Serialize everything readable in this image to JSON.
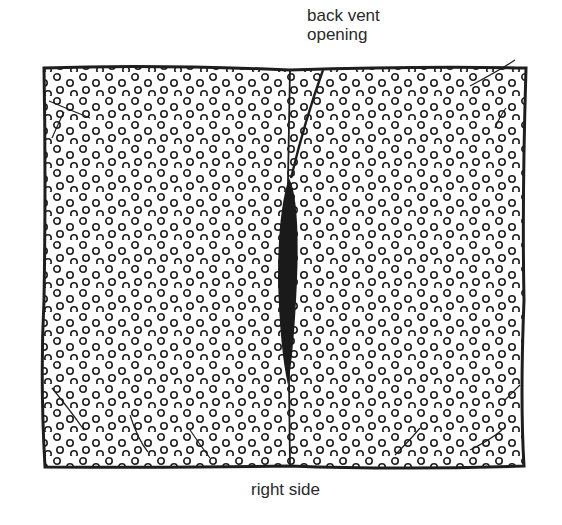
{
  "diagram": {
    "labels": {
      "top_line1": "back vent",
      "top_line2": "opening",
      "bottom": "right side"
    },
    "colors": {
      "ink": "#1e1e1e",
      "label": "#2a2a2a",
      "background": "#ffffff"
    },
    "pattern": "polka-dot rings"
  }
}
